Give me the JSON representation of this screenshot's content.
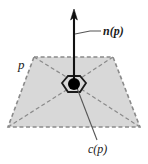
{
  "figure": {
    "canvas": {
      "width": 148,
      "height": 164
    },
    "background_color": "#ffffff",
    "labels": {
      "polygon_label": "p",
      "normal_label": "n(p)",
      "centroid_label": "c(p)"
    },
    "colors": {
      "face_fill": "#d8d8d8",
      "dashed_edge": "#8c8c8c",
      "solid_stroke": "#1a1a1a",
      "leader_line": "#555555",
      "centroid_dot": "#000000"
    },
    "geometry": {
      "trapezoid_vertices": "34,57 113,57 140,127 8,127",
      "centroid_point": {
        "x": 74,
        "y": 83
      },
      "normal_arrow": {
        "from_y": 83,
        "to_y": 12
      },
      "hexagon_half_width": 11,
      "hexagon_half_height": 9
    },
    "elements": {
      "face": "shaded trapezoid",
      "normal": "upward arrow",
      "centroid": "filled dot",
      "hexagon": "small hexagonal outline at centroid",
      "diagonals": "dashed lines from corners to centroid"
    }
  }
}
